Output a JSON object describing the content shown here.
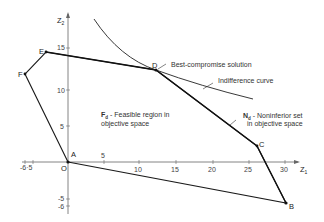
{
  "axes": {
    "x_label": "Z",
    "x_label_sub": "1",
    "y_label": "Z",
    "y_label_sub": "2",
    "origin_label": "O",
    "x_ticks": [
      {
        "label": "-6·5",
        "value": -6
      },
      {
        "label": "5",
        "value": 5
      },
      {
        "label": "10",
        "value": 10
      },
      {
        "label": "15",
        "value": 15
      },
      {
        "label": "20",
        "value": 20
      },
      {
        "label": "25",
        "value": 25
      },
      {
        "label": "30",
        "value": 30
      }
    ],
    "y_ticks": [
      {
        "label": "15",
        "value": 15
      },
      {
        "label": "10",
        "value": 10
      },
      {
        "label": "5",
        "value": 5
      },
      {
        "label": "-5",
        "value": -5
      },
      {
        "label": "-6",
        "value": -6
      }
    ]
  },
  "points": {
    "A": {
      "label": "A",
      "z1": 0,
      "z2": 0
    },
    "B": {
      "label": "B",
      "z1": 30.5,
      "z2": -6
    },
    "C": {
      "label": "C",
      "z1": 26,
      "z2": 2
    },
    "D": {
      "label": "D",
      "z1": 12,
      "z2": 12.5
    },
    "E": {
      "label": "E",
      "z1": -3,
      "z2": 14.5
    },
    "F": {
      "label": "F",
      "z1": -6,
      "z2": 12
    }
  },
  "annotations": {
    "best_compromise": "Best-compromise solution",
    "indifference": "Indifference curve",
    "feasible_symbol": "F",
    "feasible_sub": "d",
    "feasible_line1": " - Feasible region in",
    "feasible_line2": "objective space",
    "noninferior_symbol": "N",
    "noninferior_sub": "d",
    "noninferior_line1": " - Noninferior set",
    "noninferior_line2": "in objective space"
  },
  "colors": {
    "line": "#1a1a1a",
    "axis": "#555555",
    "text": "#333333",
    "background": "#ffffff"
  }
}
